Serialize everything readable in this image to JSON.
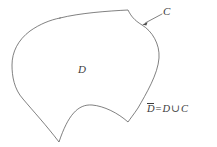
{
  "figure": {
    "kind": "mathematical-diagram",
    "background_color": "#ffffff",
    "stroke_color": "#4a4a4a",
    "text_color": "#3c3c3c",
    "canvas": {
      "width": 217,
      "height": 147
    },
    "labels": {
      "region": "D",
      "boundary_curve": "C",
      "closure": {
        "closure_symbol": "D",
        "equals": "=",
        "region_symbol": "D",
        "union_operator": "∪",
        "curve_symbol": "C",
        "full_text": "D̄ = D ∪ C"
      }
    },
    "annotation": {
      "leader_from": {
        "x": 162,
        "y": 14
      },
      "leader_to": {
        "x": 143,
        "y": 24
      },
      "arrow_target": "boundary-curve"
    },
    "boundary_path": "M 60 18 C 80 13 108 11 128 10 C 131 16 134 20 142 25 C 152 31 160 44 159 58 C 158 74 146 94 138 108 C 134 114 130 119 128 122 C 118 113 104 106 92 105 C 78 104 68 115 59 142 C 46 125 34 112 23 99 C 14 89 12 76 12 65 C 12 52 18 40 30 31 C 40 24 50 20 60 18 Z",
    "cusps": [
      {
        "name": "top-left-cusp",
        "x": 60,
        "y": 18
      },
      {
        "name": "top-right-cusp",
        "x": 128,
        "y": 10
      },
      {
        "name": "bottom-right-cusp",
        "x": 128,
        "y": 122
      },
      {
        "name": "bottom-v-cusp",
        "x": 59,
        "y": 142
      }
    ]
  }
}
